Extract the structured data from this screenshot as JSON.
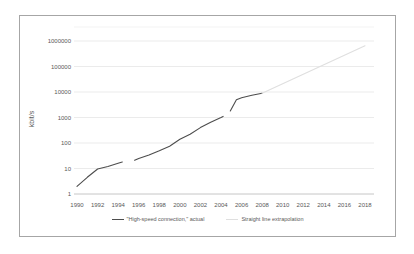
{
  "colors": {
    "text": "#595959",
    "grid": "#ebebeb",
    "axis": "#c6c6c6",
    "plot_top_border": "#f3f3f3",
    "frame_border": "#a6a6a6",
    "actual_line": "#4d4d4d",
    "extrapolation_line": "#dfdfdf",
    "background": "#ffffff"
  },
  "chart_data": {
    "type": "line",
    "title": "",
    "xlabel": "",
    "ylabel": "kbit/s",
    "y_scale": "log",
    "ylim": [
      1,
      1000000
    ],
    "y_ticks": [
      1,
      10,
      100,
      1000,
      10000,
      100000,
      1000000
    ],
    "x_ticks": [
      1990,
      1992,
      1994,
      1996,
      1998,
      2000,
      2002,
      2004,
      2006,
      2008,
      2010,
      2012,
      2014,
      2016,
      2018
    ],
    "grid": "horizontal",
    "legend_position": "bottom",
    "series": [
      {
        "name": "\"High-speed connection,\" actual",
        "color": "#4d4d4d",
        "segments": [
          [
            [
              1990,
              2
            ],
            [
              1991,
              4.5
            ],
            [
              1992,
              9.6
            ],
            [
              1993,
              12
            ],
            [
              1994,
              16
            ],
            [
              1994.4,
              18
            ]
          ],
          [
            [
              1995.6,
              21
            ],
            [
              1996,
              25
            ],
            [
              1997,
              34
            ],
            [
              1998,
              50
            ],
            [
              1999,
              75
            ],
            [
              2000,
              140
            ],
            [
              2001,
              220
            ],
            [
              2002,
              400
            ],
            [
              2003,
              650
            ],
            [
              2004,
              1000
            ],
            [
              2004.2,
              1100
            ]
          ],
          [
            [
              2004.9,
              1800
            ],
            [
              2005.5,
              5000
            ],
            [
              2006,
              6000
            ],
            [
              2007,
              7500
            ],
            [
              2008,
              9000
            ]
          ]
        ]
      },
      {
        "name": "Straight line extrapolation",
        "color": "#dfdfdf",
        "segments": [
          [
            [
              2008,
              9000
            ],
            [
              2018,
              650000
            ]
          ]
        ]
      }
    ]
  }
}
